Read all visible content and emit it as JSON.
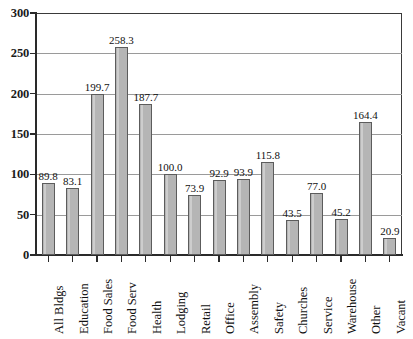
{
  "chart_data": {
    "type": "bar",
    "title": "",
    "subtitle": "",
    "xlabel": "",
    "ylabel": "",
    "ylim": [
      0,
      300
    ],
    "yticks": [
      0,
      50,
      100,
      150,
      200,
      250,
      300
    ],
    "ytick_labels": [
      "0",
      "50",
      "100",
      "150",
      "200",
      "250",
      "300"
    ],
    "grid": true,
    "legend": null,
    "bar_fill_color": "#b5b5b5",
    "bar_edge_color": "#5c5c5c",
    "gridline_color": "#9a9a9a",
    "axis_color": "#2a2a2a",
    "categories": [
      "All Bldgs",
      "Education",
      "Food Sales",
      "Food Serv",
      "Health",
      "Lodging",
      "Retail",
      "Office",
      "Assembly",
      "Safety",
      "Churches",
      "Service",
      "Warehouse",
      "Other",
      "Vacant"
    ],
    "values": [
      89.8,
      83.1,
      199.7,
      258.3,
      187.7,
      100.0,
      73.9,
      92.9,
      93.9,
      115.8,
      43.5,
      77.0,
      45.2,
      164.4,
      20.9
    ],
    "value_labels": [
      "89.8",
      "83.1",
      "199.7",
      "258.3",
      "187.7",
      "100.0",
      "73.9",
      "92.9",
      "93.9",
      "115.8",
      "43.5",
      "77.0",
      "45.2",
      "164.4",
      "20.9"
    ]
  }
}
